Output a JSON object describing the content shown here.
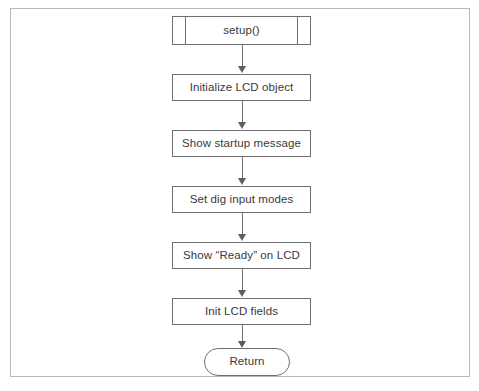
{
  "figure": {
    "kind": "flowchart",
    "orientation": "top-to-bottom",
    "border_color": "#b9b9b9",
    "node_border_color": "#6f6f6f",
    "text_color": "#3a3a3a",
    "background": "#ffffff"
  },
  "nodes": [
    {
      "id": "setup",
      "shape": "predefined-process",
      "label": "setup()"
    },
    {
      "id": "init_lcd",
      "shape": "process",
      "label": "Initialize LCD object"
    },
    {
      "id": "startup_msg",
      "shape": "process",
      "label": "Show startup message"
    },
    {
      "id": "input_modes",
      "shape": "process",
      "label": "Set dig input modes"
    },
    {
      "id": "ready_lcd",
      "shape": "process",
      "label": "Show “Ready” on LCD"
    },
    {
      "id": "lcd_fields",
      "shape": "process",
      "label": "Init LCD fields"
    },
    {
      "id": "return",
      "shape": "terminator",
      "label": "Return"
    }
  ],
  "edges": [
    {
      "from": "setup",
      "to": "init_lcd",
      "arrow": "down"
    },
    {
      "from": "init_lcd",
      "to": "startup_msg",
      "arrow": "down"
    },
    {
      "from": "startup_msg",
      "to": "input_modes",
      "arrow": "down"
    },
    {
      "from": "input_modes",
      "to": "ready_lcd",
      "arrow": "down"
    },
    {
      "from": "ready_lcd",
      "to": "lcd_fields",
      "arrow": "down"
    },
    {
      "from": "lcd_fields",
      "to": "return",
      "arrow": "down"
    }
  ]
}
